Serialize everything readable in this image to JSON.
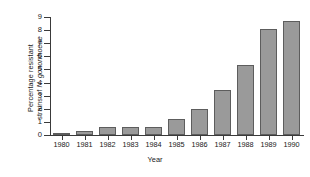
{
  "chart_data": {
    "type": "bar",
    "title": "",
    "xlabel": "Year",
    "ylabel_line1": "Percentage resistant",
    "ylabel_line2_prefix": "strains of ",
    "ylabel_line2_italic": "N. gonorrhoeae",
    "categories": [
      "1980",
      "1981",
      "1982",
      "1983",
      "1984",
      "1985",
      "1986",
      "1987",
      "1988",
      "1989",
      "1990"
    ],
    "values": [
      0.15,
      0.3,
      0.6,
      0.6,
      0.6,
      1.2,
      2.0,
      3.4,
      5.35,
      8.1,
      8.7
    ],
    "ylim": [
      0,
      9
    ],
    "yticks": [
      0,
      1,
      2,
      3,
      4,
      5,
      6,
      7,
      8,
      9
    ],
    "ytick_labels": [
      "0",
      "1",
      "2",
      "3",
      "4",
      "5",
      "6",
      "7",
      "8",
      "9"
    ],
    "grid": false,
    "legend": false,
    "bar_fill_color": "#9a9a9a",
    "bar_edge_color": "#5d5d5d",
    "axis_color": "#3a3a3a"
  }
}
